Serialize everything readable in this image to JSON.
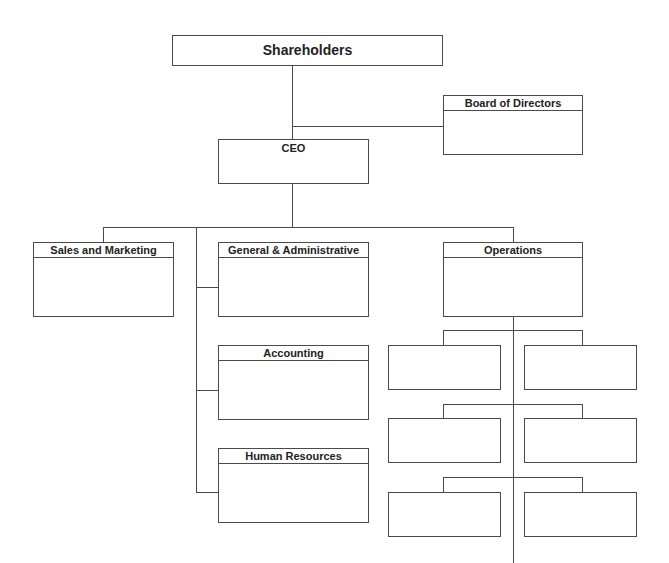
{
  "diagram": {
    "type": "org-chart",
    "nodes": {
      "shareholders": "Shareholders",
      "board": "Board of Directors",
      "ceo": "CEO",
      "sales": "Sales and Marketing",
      "ga": "General & Administrative",
      "accounting": "Accounting",
      "hr": "Human Resources",
      "operations": "Operations"
    },
    "edges": [
      [
        "shareholders",
        "ceo"
      ],
      [
        "shareholders",
        "board"
      ],
      [
        "ceo",
        "sales"
      ],
      [
        "ceo",
        "ga"
      ],
      [
        "ceo",
        "accounting"
      ],
      [
        "ceo",
        "hr"
      ],
      [
        "ceo",
        "operations"
      ],
      [
        "operations",
        "ops-unit-1"
      ],
      [
        "operations",
        "ops-unit-2"
      ],
      [
        "operations",
        "ops-unit-3"
      ],
      [
        "operations",
        "ops-unit-4"
      ],
      [
        "operations",
        "ops-unit-5"
      ],
      [
        "operations",
        "ops-unit-6"
      ]
    ],
    "operations_subunits": [
      "",
      "",
      "",
      "",
      "",
      ""
    ]
  }
}
